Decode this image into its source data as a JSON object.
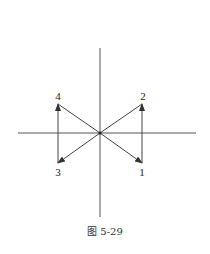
{
  "figure": {
    "caption": "图 5-29",
    "axes": {
      "horizontal": {
        "x1": 18,
        "y1": 133,
        "x2": 196,
        "y2": 133
      },
      "vertical": {
        "x1": 100,
        "y1": 48,
        "x2": 100,
        "y2": 217
      }
    },
    "origin": {
      "x": 100,
      "y": 133
    },
    "points": [
      {
        "id": "1",
        "label": "1",
        "x": 142,
        "y": 163,
        "label_x": 142,
        "label_y": 176
      },
      {
        "id": "2",
        "label": "2",
        "x": 142,
        "y": 104,
        "label_x": 143,
        "label_y": 100
      },
      {
        "id": "3",
        "label": "3",
        "x": 58,
        "y": 163,
        "label_x": 58,
        "label_y": 176
      },
      {
        "id": "4",
        "label": "4",
        "x": 58,
        "y": 104,
        "label_x": 58,
        "label_y": 100
      }
    ],
    "edges": [
      {
        "from": "origin",
        "to": "1",
        "arrow": true
      },
      {
        "from": "1",
        "to": "2",
        "arrow": true
      },
      {
        "from": "2",
        "to": "origin",
        "arrow": false
      },
      {
        "from": "origin",
        "to": "3",
        "arrow": true
      },
      {
        "from": "3",
        "to": "4",
        "arrow": true
      },
      {
        "from": "4",
        "to": "origin",
        "arrow": false
      }
    ],
    "colors": {
      "line": "#444444",
      "axis": "#555555",
      "text": "#222222"
    }
  }
}
